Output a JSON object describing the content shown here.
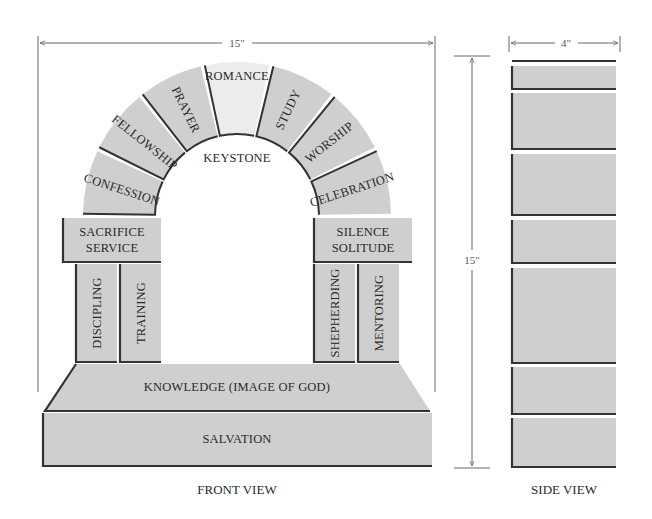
{
  "dimensions": {
    "front_width": "15\"",
    "front_height": "15\"",
    "side_width": "4\""
  },
  "arch": {
    "voussoirs": [
      "CONFESSION",
      "FELLOWSHIP",
      "PRAYER",
      "ROMANCE",
      "STUDY",
      "WORSHIP",
      "CELEBRATION"
    ],
    "keystone_label": "KEYSTONE"
  },
  "capitals": {
    "left": [
      "SACRIFICE",
      "SERVICE"
    ],
    "right": [
      "SILENCE",
      "SOLITUDE"
    ]
  },
  "columns": {
    "left": [
      "DISCIPLING",
      "TRAINING"
    ],
    "right": [
      "SHEPHERDING",
      "MENTORING"
    ]
  },
  "base": {
    "upper": "KNOWLEDGE (IMAGE OF GOD)",
    "lower": "SALVATION"
  },
  "captions": {
    "front": "FRONT VIEW",
    "side": "SIDE VIEW"
  },
  "colors": {
    "stone": "#cfcfcf",
    "edge": "#333333",
    "keystone_fill": "#ececec",
    "background": "#ffffff"
  }
}
